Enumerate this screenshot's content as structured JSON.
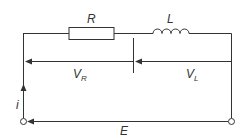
{
  "diagram": {
    "type": "series RL circuit",
    "components": {
      "resistor": {
        "label": "R"
      },
      "inductor": {
        "label": "L"
      }
    },
    "voltages": {
      "resistor_voltage": {
        "main": "V",
        "sub": "R"
      },
      "inductor_voltage": {
        "main": "V",
        "sub": "L"
      },
      "supply": "E"
    },
    "current": "i",
    "colors": {
      "line": "#333333",
      "background": "#ffffff"
    }
  }
}
